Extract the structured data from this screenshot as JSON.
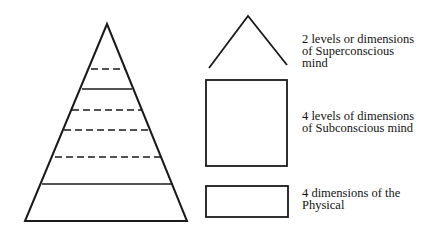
{
  "diagram": {
    "labels": {
      "superconscious": [
        "2 levels or dimensions",
        "of Superconscious",
        "mind"
      ],
      "subconscious": [
        "4 levels of dimensions",
        "of Subconscious mind"
      ],
      "physical": [
        "4 dimensions of the",
        "Physical"
      ]
    },
    "pyramid": {
      "divisions_top_to_bottom": [
        "dashed",
        "solid",
        "dashed",
        "dashed",
        "dashed",
        "solid"
      ]
    },
    "stroke_color": "#1a1a1a"
  }
}
